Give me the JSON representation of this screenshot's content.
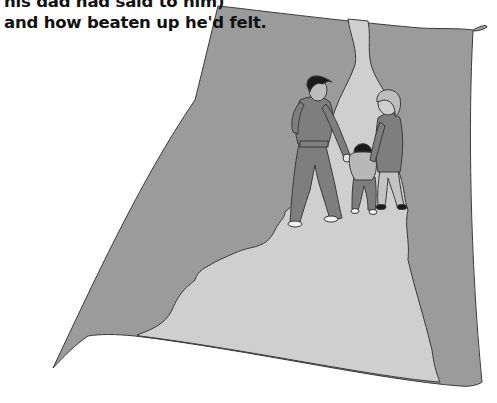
{
  "caption": {
    "lines": [
      "his dad had said to him)",
      "and how beaten up he'd felt."
    ]
  },
  "illustration": {
    "description": "A man, a woman and a small child walking hand in hand along a light path through a curled grey sheet",
    "colors": {
      "background": "#ffffff",
      "sheet": "#9b9b9b",
      "path": "#cfcfcf",
      "outline": "#3a3a3a",
      "figure_dark": "#7e7e7e",
      "figure_light": "#b8b8b8",
      "hair": "#1a1a1a",
      "shoe": "#f2f2f2"
    },
    "figures": [
      "man",
      "child",
      "woman"
    ]
  }
}
